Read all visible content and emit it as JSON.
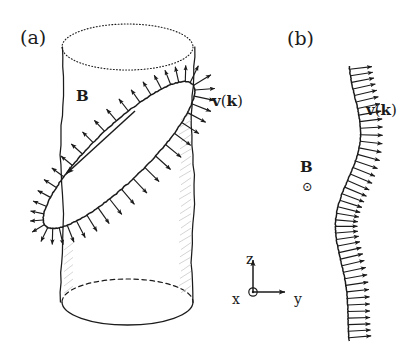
{
  "figure": {
    "width": 411,
    "height": 359,
    "background": "#ffffff",
    "ink": "#1b1b1b"
  },
  "panels": [
    {
      "id": "a",
      "label": "(a)",
      "label_x": 20,
      "label_y": 28,
      "annotations": {
        "field_label": "B",
        "field_label_x": 76,
        "field_label_y": 89,
        "velocity_label_v": "v",
        "velocity_label_paren_open": "(",
        "velocity_label_k": "k",
        "velocity_label_paren_close": ")",
        "velocity_label_x": 212,
        "velocity_label_y": 94
      },
      "cylinder": {
        "left_x": 62,
        "right_x": 193,
        "top_y": 47,
        "bottom_y": 302,
        "ellipse_rx": 65.5,
        "ellipse_ry": 23,
        "top_ellipse_style": "dotted",
        "bottom_back_style": "dashed",
        "bottom_front_style": "solid",
        "side_style": "wavy-solid"
      },
      "orbit": {
        "type": "tilted-ellipse",
        "center_x": 119,
        "center_y": 155,
        "semi_major": 102,
        "semi_minor": 27,
        "rotation_deg": -44,
        "arrow_count": 40,
        "arrow_direction": "outward-normal"
      },
      "field_line": {
        "x1": 135,
        "y1": 111,
        "x2": 66,
        "y2": 174,
        "arrowhead_at": "x2,y2"
      }
    },
    {
      "id": "b",
      "label": "(b)",
      "label_x": 287,
      "label_y": 29,
      "annotations": {
        "field_label": "B",
        "field_label_x": 300,
        "field_label_y": 160,
        "field_symbol": "⊙",
        "field_symbol_meaning": "out-of-page",
        "field_symbol_x": 302,
        "field_symbol_y": 180,
        "velocity_label_v": "v",
        "velocity_label_paren_open": "(",
        "velocity_label_k": "k",
        "velocity_label_paren_close": ")",
        "velocity_label_x": 366,
        "velocity_label_y": 103
      },
      "curve": {
        "type": "wavy-vertical",
        "top_y": 66,
        "bottom_y": 341,
        "mean_x": 348,
        "amplitude": 10,
        "arrow_count": 42,
        "arrow_direction": "right-normal"
      }
    }
  ],
  "axes_triad": {
    "origin_x": 253,
    "origin_y": 292,
    "z_label": "z",
    "z_label_x": 246,
    "z_label_y": 252,
    "y_label": "y",
    "y_label_x": 294,
    "y_label_y": 292,
    "x_label": "x",
    "x_label_x": 232,
    "x_label_y": 292,
    "x_symbol": "⊙",
    "x_symbol_meaning": "out-of-page",
    "z_arrow_length": 32,
    "y_arrow_length": 32
  }
}
